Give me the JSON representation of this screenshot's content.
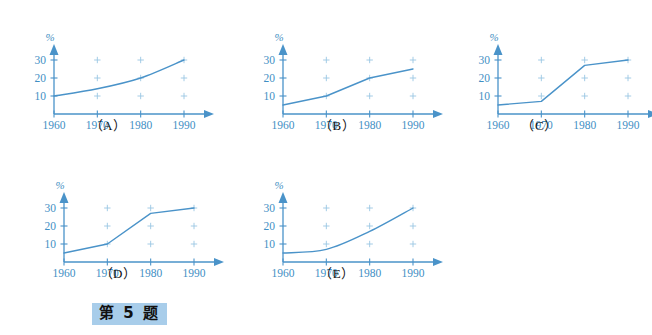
{
  "page": {
    "background": "#ffffff",
    "accent_color": "#4a93c9",
    "label_color": "#3f8fc4",
    "caption_color": "#111111",
    "highlight_color": "#a8cdea"
  },
  "footer": {
    "tag_text": "第 5 题"
  },
  "axes": {
    "y_unit_label": "%",
    "y_ticks": [
      "30",
      "20",
      "10"
    ],
    "y_tick_values": [
      30,
      20,
      10
    ],
    "x_ticks": [
      "1960",
      "1970",
      "1980",
      "1990"
    ],
    "x_tick_values": [
      1960,
      1970,
      1980,
      1990
    ],
    "y_range": [
      0,
      33
    ],
    "x_range": [
      1960,
      1992
    ],
    "grid_marker": "+",
    "grid_marker_x": [
      1970,
      1980,
      1990
    ],
    "grid_marker_y": [
      10,
      20,
      30
    ]
  },
  "charts": [
    {
      "id": "A",
      "caption": "（A）",
      "chart_data": {
        "type": "line",
        "title": "",
        "xlabel": "",
        "ylabel": "%",
        "x": [
          1960,
          1970,
          1980,
          1990
        ],
        "values": [
          10,
          14,
          20,
          30
        ],
        "smooth": true,
        "xlim": [
          1960,
          1992
        ],
        "ylim": [
          0,
          33
        ],
        "grid": false,
        "legend": "none"
      }
    },
    {
      "id": "B",
      "caption": "（B）",
      "chart_data": {
        "type": "line",
        "title": "",
        "xlabel": "",
        "ylabel": "%",
        "x": [
          1960,
          1970,
          1980,
          1990
        ],
        "values": [
          5,
          10,
          20,
          25
        ],
        "smooth": false,
        "xlim": [
          1960,
          1992
        ],
        "ylim": [
          0,
          33
        ],
        "grid": false,
        "legend": "none"
      }
    },
    {
      "id": "C",
      "caption": "（C）",
      "chart_data": {
        "type": "line",
        "title": "",
        "xlabel": "",
        "ylabel": "%",
        "x": [
          1960,
          1970,
          1980,
          1990
        ],
        "values": [
          5,
          7,
          27,
          30
        ],
        "smooth": false,
        "xlim": [
          1960,
          1992
        ],
        "ylim": [
          0,
          33
        ],
        "grid": false,
        "legend": "none"
      }
    },
    {
      "id": "D",
      "caption": "（D）",
      "chart_data": {
        "type": "line",
        "title": "",
        "xlabel": "",
        "ylabel": "%",
        "x": [
          1960,
          1970,
          1980,
          1990
        ],
        "values": [
          5,
          10,
          27,
          30
        ],
        "smooth": false,
        "xlim": [
          1960,
          1992
        ],
        "ylim": [
          0,
          33
        ],
        "grid": false,
        "legend": "none"
      }
    },
    {
      "id": "E",
      "caption": "（E）",
      "chart_data": {
        "type": "line",
        "title": "",
        "xlabel": "",
        "ylabel": "%",
        "x": [
          1960,
          1970,
          1980,
          1990
        ],
        "values": [
          5,
          7,
          17,
          30
        ],
        "smooth": true,
        "xlim": [
          1960,
          1992
        ],
        "ylim": [
          0,
          33
        ],
        "grid": false,
        "legend": "none"
      }
    }
  ]
}
